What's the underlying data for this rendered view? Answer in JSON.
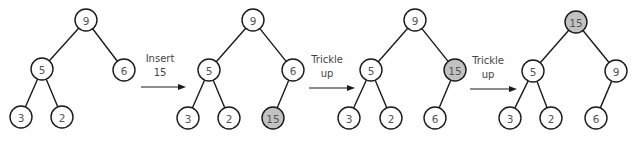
{
  "colors": {
    "node_fill": "#ffffff",
    "highlight_fill": "#c2c2c2",
    "stroke": "#1a1a1a",
    "text": "#555555"
  },
  "node_radius": 11,
  "trees": [
    {
      "id": "tree-1-initial",
      "nodes": [
        {
          "id": "n9",
          "label": "9",
          "x": 86,
          "y": 20,
          "highlight": false
        },
        {
          "id": "n5",
          "label": "5",
          "x": 42,
          "y": 69,
          "highlight": false
        },
        {
          "id": "n6",
          "label": "6",
          "x": 124,
          "y": 70,
          "highlight": false
        },
        {
          "id": "n3",
          "label": "3",
          "x": 21,
          "y": 117,
          "highlight": false
        },
        {
          "id": "n2",
          "label": "2",
          "x": 62,
          "y": 117,
          "highlight": false
        }
      ],
      "edges": [
        [
          "n9",
          "n5"
        ],
        [
          "n9",
          "n6"
        ],
        [
          "n5",
          "n3"
        ],
        [
          "n5",
          "n2"
        ]
      ]
    },
    {
      "id": "tree-2-inserted",
      "nodes": [
        {
          "id": "n9",
          "label": "9",
          "x": 253,
          "y": 20,
          "highlight": false
        },
        {
          "id": "n5",
          "label": "5",
          "x": 209,
          "y": 70,
          "highlight": false
        },
        {
          "id": "n6",
          "label": "6",
          "x": 293,
          "y": 70,
          "highlight": false
        },
        {
          "id": "n3",
          "label": "3",
          "x": 188,
          "y": 118,
          "highlight": false
        },
        {
          "id": "n2",
          "label": "2",
          "x": 229,
          "y": 118,
          "highlight": false
        },
        {
          "id": "n15",
          "label": "15",
          "x": 273,
          "y": 118,
          "highlight": true
        }
      ],
      "edges": [
        [
          "n9",
          "n5"
        ],
        [
          "n9",
          "n6"
        ],
        [
          "n5",
          "n3"
        ],
        [
          "n5",
          "n2"
        ],
        [
          "n6",
          "n15"
        ]
      ]
    },
    {
      "id": "tree-3-trickle-1",
      "nodes": [
        {
          "id": "n9",
          "label": "9",
          "x": 415,
          "y": 20,
          "highlight": false
        },
        {
          "id": "n5",
          "label": "5",
          "x": 371,
          "y": 70,
          "highlight": false
        },
        {
          "id": "n15",
          "label": "15",
          "x": 455,
          "y": 70,
          "highlight": true
        },
        {
          "id": "n3",
          "label": "3",
          "x": 349,
          "y": 118,
          "highlight": false
        },
        {
          "id": "n2",
          "label": "2",
          "x": 391,
          "y": 118,
          "highlight": false
        },
        {
          "id": "n6",
          "label": "6",
          "x": 435,
          "y": 118,
          "highlight": false
        }
      ],
      "edges": [
        [
          "n9",
          "n5"
        ],
        [
          "n9",
          "n15"
        ],
        [
          "n5",
          "n3"
        ],
        [
          "n5",
          "n2"
        ],
        [
          "n15",
          "n6"
        ]
      ]
    },
    {
      "id": "tree-4-trickle-2",
      "nodes": [
        {
          "id": "n15",
          "label": "15",
          "x": 576,
          "y": 22,
          "highlight": true
        },
        {
          "id": "n5",
          "label": "5",
          "x": 533,
          "y": 71,
          "highlight": false
        },
        {
          "id": "n9",
          "label": "9",
          "x": 616,
          "y": 71,
          "highlight": false
        },
        {
          "id": "n3",
          "label": "3",
          "x": 510,
          "y": 118,
          "highlight": false
        },
        {
          "id": "n2",
          "label": "2",
          "x": 551,
          "y": 118,
          "highlight": false
        },
        {
          "id": "n6",
          "label": "6",
          "x": 596,
          "y": 118,
          "highlight": false
        }
      ],
      "edges": [
        [
          "n15",
          "n5"
        ],
        [
          "n15",
          "n9"
        ],
        [
          "n5",
          "n3"
        ],
        [
          "n5",
          "n2"
        ],
        [
          "n9",
          "n6"
        ]
      ]
    }
  ],
  "steps": [
    {
      "id": "step-insert",
      "lines": [
        "Insert",
        "15"
      ],
      "text_x": 160,
      "text_y1": 62,
      "text_y2": 76,
      "arrow_x1": 141,
      "arrow_x2": 186,
      "arrow_y": 87
    },
    {
      "id": "step-trickle-1",
      "lines": [
        "Trickle",
        "up"
      ],
      "text_x": 327,
      "text_y1": 63,
      "text_y2": 77,
      "arrow_x1": 309,
      "arrow_x2": 355,
      "arrow_y": 88
    },
    {
      "id": "step-trickle-2",
      "lines": [
        "Trickle",
        "up"
      ],
      "text_x": 488,
      "text_y1": 64,
      "text_y2": 78,
      "arrow_x1": 470,
      "arrow_x2": 517,
      "arrow_y": 89
    }
  ]
}
